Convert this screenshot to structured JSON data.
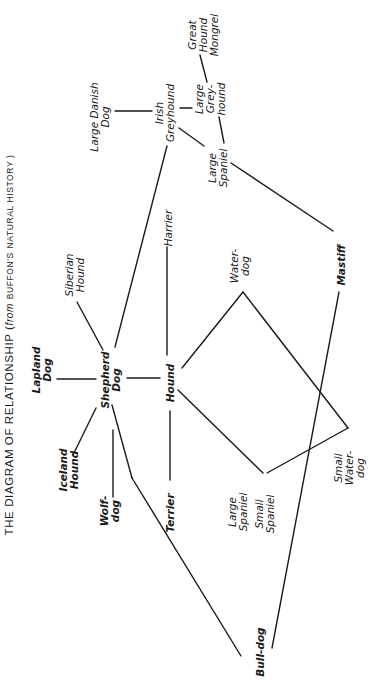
{
  "title": {
    "main": "THE DIAGRAM OF RELATIONSHIP (",
    "from": "from",
    "source": "BUFFON'S",
    "tail": "NATURAL HISTORY )"
  },
  "nodes": [
    {
      "id": "shepherd",
      "label": "Shepherd\nDog",
      "x": 111,
      "y": 380,
      "bold": true
    },
    {
      "id": "hound",
      "label": "Hound",
      "x": 170,
      "y": 383,
      "bold": true
    },
    {
      "id": "lapland",
      "label": "Lapland\nDog",
      "x": 42,
      "y": 370,
      "bold": true
    },
    {
      "id": "siberian",
      "label": "Siberian\nHound",
      "x": 75,
      "y": 275,
      "bold": false
    },
    {
      "id": "iceland",
      "label": "Iceland\nHound",
      "x": 69,
      "y": 470,
      "bold": true
    },
    {
      "id": "wolfdog",
      "label": "Wolf-\ndog",
      "x": 110,
      "y": 511,
      "bold": true
    },
    {
      "id": "terrier",
      "label": "Terrier",
      "x": 170,
      "y": 513,
      "bold": true
    },
    {
      "id": "harrier",
      "label": "Harrier",
      "x": 168,
      "y": 228,
      "bold": false
    },
    {
      "id": "irish",
      "label": "Irish\nGreyhound",
      "x": 165,
      "y": 113,
      "bold": false
    },
    {
      "id": "danish",
      "label": "Large Danish\nDog",
      "x": 100,
      "y": 117,
      "bold": false
    },
    {
      "id": "largegrey",
      "label": "Large\nGrey-\nhound",
      "x": 210,
      "y": 99,
      "bold": false
    },
    {
      "id": "mongrel",
      "label": "Great\nHound\nMongrel",
      "x": 203,
      "y": 35,
      "bold": false
    },
    {
      "id": "largespaniel_top",
      "label": "Large\nSpaniel",
      "x": 218,
      "y": 168,
      "bold": false
    },
    {
      "id": "waterdog",
      "label": "Water-\ndog",
      "x": 240,
      "y": 266,
      "bold": false
    },
    {
      "id": "mastiff",
      "label": "Mastiff",
      "x": 341,
      "y": 265,
      "bold": true
    },
    {
      "id": "largespaniel_bot",
      "label": "Large\nSpaniel",
      "x": 238,
      "y": 512,
      "bold": false
    },
    {
      "id": "smallspaniel",
      "label": "Small\nSpaniel",
      "x": 265,
      "y": 514,
      "bold": false
    },
    {
      "id": "smallwaterdog",
      "label": "Small\nWater-\ndog",
      "x": 349,
      "y": 468,
      "bold": false
    },
    {
      "id": "bulldog",
      "label": "Bull-dog",
      "x": 260,
      "y": 652,
      "bold": true
    }
  ],
  "edges": [
    {
      "from": "shepherd",
      "to": "lapland",
      "x1": 57,
      "y1": 379,
      "x2": 96,
      "y2": 379
    },
    {
      "from": "shepherd",
      "to": "siberian",
      "x1": 77,
      "y1": 302,
      "x2": 103,
      "y2": 350
    },
    {
      "from": "shepherd",
      "to": "irish",
      "x1": 115,
      "y1": 347,
      "x2": 167,
      "y2": 146
    },
    {
      "from": "shepherd",
      "to": "hound",
      "x1": 127,
      "y1": 378,
      "x2": 160,
      "y2": 378
    },
    {
      "from": "shepherd",
      "to": "iceland",
      "x1": 73,
      "y1": 455,
      "x2": 96,
      "y2": 408
    },
    {
      "from": "shepherd",
      "to": "wolfdog",
      "x1": 113,
      "y1": 430,
      "x2": 113,
      "y2": 497
    },
    {
      "from": "shepherd",
      "to": "bulldog",
      "x1": 112,
      "y1": 405,
      "x2": 132,
      "y2": 478
    },
    {
      "from": "shepherd",
      "to": "bulldog-seg2",
      "x1": 132,
      "y1": 478,
      "x2": 241,
      "y2": 656
    },
    {
      "from": "hound",
      "to": "harrier",
      "x1": 167,
      "y1": 247,
      "x2": 167,
      "y2": 355
    },
    {
      "from": "hound",
      "to": "terrier",
      "x1": 170,
      "y1": 411,
      "x2": 170,
      "y2": 480
    },
    {
      "from": "hound",
      "to": "waterdog",
      "x1": 182,
      "y1": 368,
      "x2": 243,
      "y2": 292
    },
    {
      "from": "hound",
      "to": "largespaniel_bot",
      "x1": 178,
      "y1": 390,
      "x2": 263,
      "y2": 473
    },
    {
      "from": "waterdog",
      "to": "smallwaterdog",
      "x1": 243,
      "y1": 292,
      "x2": 348,
      "y2": 428
    },
    {
      "from": "smallwaterdog",
      "to": "largespaniel_bot",
      "x1": 348,
      "y1": 428,
      "x2": 267,
      "y2": 473
    },
    {
      "from": "mastiff",
      "to": "bulldog",
      "x1": 339,
      "y1": 292,
      "x2": 272,
      "y2": 648
    },
    {
      "from": "largespaniel_top",
      "to": "mastiff",
      "x1": 231,
      "y1": 163,
      "x2": 333,
      "y2": 231
    },
    {
      "from": "irish",
      "to": "danish",
      "x1": 115,
      "y1": 111,
      "x2": 152,
      "y2": 111
    },
    {
      "from": "irish",
      "to": "largegrey",
      "x1": 180,
      "y1": 108,
      "x2": 192,
      "y2": 108
    },
    {
      "from": "irish",
      "to": "largespaniel_top",
      "x1": 179,
      "y1": 128,
      "x2": 204,
      "y2": 146
    },
    {
      "from": "largegrey",
      "to": "mongrel",
      "x1": 200,
      "y1": 55,
      "x2": 207,
      "y2": 82
    },
    {
      "from": "largegrey",
      "to": "largespaniel_top",
      "x1": 219,
      "y1": 117,
      "x2": 224,
      "y2": 143
    }
  ],
  "colors": {
    "ink": "#1a1a1a",
    "paper": "#ffffff"
  }
}
